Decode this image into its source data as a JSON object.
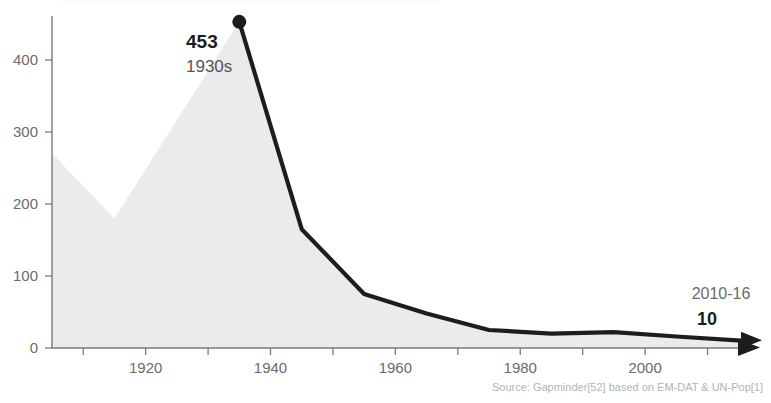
{
  "chart_data": {
    "type": "area",
    "title": "",
    "xlabel": "",
    "ylabel": "",
    "xlim": [
      1905,
      2016
    ],
    "ylim": [
      0,
      465
    ],
    "grid": false,
    "legend": "none",
    "x_ticks": [
      1910,
      1920,
      1930,
      1940,
      1950,
      1960,
      1970,
      1980,
      1990,
      2000,
      2010
    ],
    "x_tick_labels": [
      "",
      "1920",
      "",
      "1940",
      "",
      "1960",
      "",
      "1980",
      "",
      "2000",
      ""
    ],
    "y_ticks": [
      0,
      100,
      200,
      300,
      400
    ],
    "y_tick_labels": [
      "0",
      "100",
      "200",
      "300",
      "400"
    ],
    "series": [
      {
        "name": "Deaths per decade (area)",
        "style": "area-fill",
        "color": "#ebebeb",
        "x": [
          1905,
          1915,
          1935,
          1945,
          1955,
          1965,
          1975,
          1985,
          1995,
          2005,
          2016
        ],
        "values": [
          270,
          180,
          453,
          165,
          75,
          48,
          25,
          20,
          22,
          16,
          10
        ]
      },
      {
        "name": "Deaths per decade (line)",
        "style": "line",
        "color": "#1d1d1d",
        "x": [
          1935,
          1945,
          1955,
          1965,
          1975,
          1985,
          1995,
          2005,
          2016
        ],
        "values": [
          453,
          165,
          75,
          48,
          25,
          20,
          22,
          16,
          10
        ]
      }
    ],
    "annotations": [
      {
        "name": "peak-annotation",
        "value_label": "453",
        "period_label": "1930s",
        "x": 1935,
        "y": 453,
        "marker": "dot"
      },
      {
        "name": "end-annotation",
        "period_label": "2010-16",
        "value_label": "10",
        "x": 2013,
        "y": 10,
        "marker": "arrow"
      }
    ]
  },
  "source": {
    "text": "Source: Gapminder[52] based on EM-DAT & UN-Pop[1]"
  },
  "colors": {
    "area_fill": "#ebebeb",
    "line": "#1d1d1d",
    "axis": "#7a7a7a",
    "tick_text": "#6b6b6b",
    "annotation_value": "#1d1d1d",
    "annotation_period": "#555555",
    "source_text": "#b3b3b3",
    "background": "#ffffff"
  }
}
